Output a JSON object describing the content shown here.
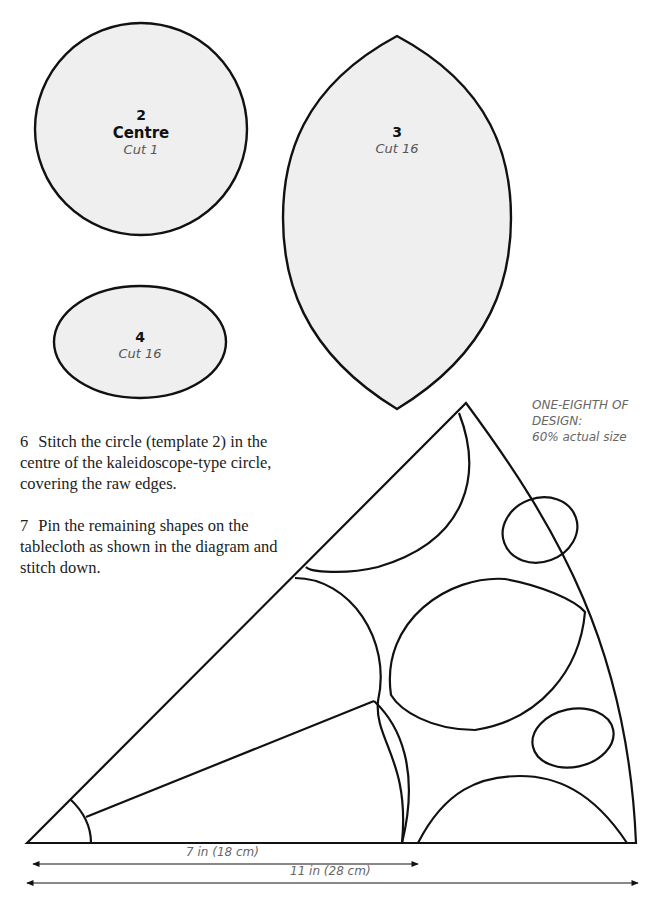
{
  "templates": [
    {
      "number": "2",
      "name": "Centre",
      "cut": "Cut 1",
      "shape": "circle"
    },
    {
      "number": "3",
      "name": "",
      "cut": "Cut 16",
      "shape": "leaf"
    },
    {
      "number": "4",
      "name": "",
      "cut": "Cut 16",
      "shape": "oval"
    }
  ],
  "instructions": [
    {
      "number": "6",
      "text": "Stitch the circle (template 2) in the centre of the kaleidoscope-type circle, covering the raw edges."
    },
    {
      "number": "7",
      "text": "Pin the remaining shapes on the tablecloth as shown in the diagram and stitch down."
    }
  ],
  "diagram": {
    "caption_line1": "ONE-EIGHTH OF",
    "caption_line2": "DESIGN:",
    "caption_line3": "60% actual size",
    "dimension_short": "7 in (18 cm)",
    "dimension_long": "11 in (28 cm)"
  },
  "colors": {
    "template_fill": "#efefef",
    "stroke": "#111111",
    "caption_text": "#666666"
  }
}
